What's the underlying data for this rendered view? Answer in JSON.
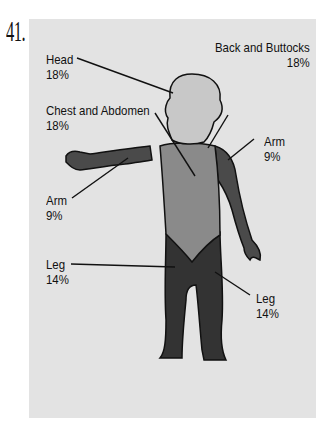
{
  "question_number": "41.",
  "labels": {
    "head": {
      "name": "Head",
      "pct": "18%"
    },
    "chest": {
      "name": "Chest and Abdomen",
      "pct": "18%"
    },
    "back": {
      "name": "Back and Buttocks",
      "pct": "18%"
    },
    "arm_left": {
      "name": "Arm",
      "pct": "9%"
    },
    "arm_right": {
      "name": "Arm",
      "pct": "9%"
    },
    "leg_left": {
      "name": "Leg",
      "pct": "14%"
    },
    "leg_right": {
      "name": "Leg",
      "pct": "14%"
    }
  },
  "colors": {
    "background": "#e3e3e3",
    "head": "#c8c8c8",
    "torso": "#8a8a8a",
    "limbs": "#4a4a4a",
    "legs": "#333333"
  }
}
